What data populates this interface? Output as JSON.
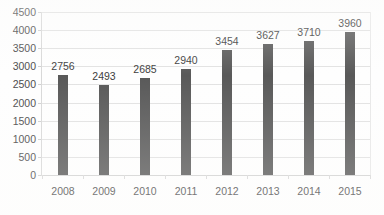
{
  "chart_data": {
    "type": "bar",
    "title": "",
    "xlabel": "",
    "ylabel": "",
    "categories": [
      "2008",
      "2009",
      "2010",
      "2011",
      "2012",
      "2013",
      "2014",
      "2015"
    ],
    "values": [
      2756,
      2493,
      2685,
      2940,
      3454,
      3627,
      3710,
      3960
    ],
    "data_labels": [
      "2756",
      "2493",
      "2685",
      "2940",
      "3454",
      "3627",
      "3710",
      "3960"
    ],
    "ylim": [
      0,
      4500
    ],
    "ytick_step": 500,
    "yticks": [
      "0",
      "500",
      "1000",
      "1500",
      "2000",
      "2500",
      "3000",
      "3500",
      "4000",
      "4500"
    ],
    "grid": true,
    "legend": false,
    "legend_position": "none",
    "series": [
      {
        "name": "",
        "values": [
          2756,
          2493,
          2685,
          2940,
          3454,
          3627,
          3710,
          3960
        ]
      }
    ],
    "colors": {
      "bar": "#595959",
      "gridline": "#e2e2e2",
      "axis": "#d8d8d8",
      "label_text": "#3c3c3c",
      "tick_text": "#4a4a4a",
      "background": "#fefefe"
    }
  }
}
